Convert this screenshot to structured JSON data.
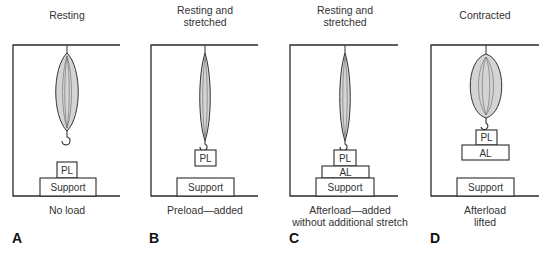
{
  "panels": [
    {
      "letter": "A",
      "title": "Resting",
      "caption": "No load",
      "boxes": {
        "pl": "PL",
        "support": "Support"
      }
    },
    {
      "letter": "B",
      "title": "Resting and\nstretched",
      "caption": "Preload—added",
      "boxes": {
        "pl": "PL",
        "support": "Support"
      }
    },
    {
      "letter": "C",
      "title": "Resting and\nstretched",
      "caption": "Afterload—added\nwithout additional stretch",
      "boxes": {
        "pl": "PL",
        "al": "AL",
        "support": "Support"
      }
    },
    {
      "letter": "D",
      "title": "Contracted",
      "caption": "Afterload\nlifted",
      "boxes": {
        "pl": "PL",
        "al": "AL",
        "support": "Support"
      }
    }
  ],
  "colors": {
    "line": "#2a2a2a",
    "muscle_fill": "#d4d4d4",
    "muscle_stroke": "#333333",
    "fiber": "#555555"
  }
}
